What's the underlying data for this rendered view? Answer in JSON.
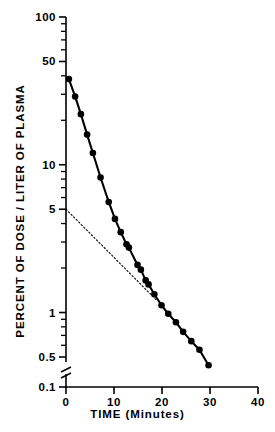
{
  "chart_data": {
    "type": "line",
    "title": "",
    "xlabel": "TIME   (Minutes)",
    "ylabel": "PERCENT OF DOSE / LITER OF PLASMA",
    "yscale": "log",
    "xscale": "linear",
    "xlim": [
      0,
      40
    ],
    "ylim": [
      0.1,
      100
    ],
    "grid": false,
    "legend": null,
    "xticks": [
      {
        "value": 0,
        "label": "0"
      },
      {
        "value": 10,
        "label": "10"
      },
      {
        "value": 20,
        "label": "20"
      },
      {
        "value": 30,
        "label": "30"
      },
      {
        "value": 40,
        "label": "40"
      }
    ],
    "yticks_major": [
      {
        "value": 100,
        "label": "100"
      },
      {
        "value": 50,
        "label": "50"
      },
      {
        "value": 10,
        "label": "10"
      },
      {
        "value": 5,
        "label": "5"
      },
      {
        "value": 1,
        "label": "1"
      },
      {
        "value": 0.5,
        "label": "0.5"
      },
      {
        "value": 0.1,
        "label": "0.1"
      }
    ],
    "yticks_minor": [
      90,
      80,
      70,
      60,
      40,
      30,
      20,
      9,
      8,
      7,
      6,
      4,
      3,
      2,
      0.9,
      0.8,
      0.7,
      0.6,
      0.4,
      0.3,
      0.2
    ],
    "axis_break": {
      "axis": "y",
      "between": [
        0.5,
        0.1
      ],
      "symbol": "zigzag"
    },
    "series": [
      {
        "name": "plasma concentration",
        "style": "solid-line-with-filled-circles",
        "marker": "filled-circle",
        "points": [
          {
            "x": 0.6,
            "y": 38.0
          },
          {
            "x": 1.9,
            "y": 29.0
          },
          {
            "x": 3.1,
            "y": 22.0
          },
          {
            "x": 4.4,
            "y": 16.0
          },
          {
            "x": 5.6,
            "y": 12.0
          },
          {
            "x": 7.2,
            "y": 8.2
          },
          {
            "x": 8.9,
            "y": 5.6
          },
          {
            "x": 10.2,
            "y": 4.3
          },
          {
            "x": 11.4,
            "y": 3.5
          },
          {
            "x": 12.6,
            "y": 2.9
          },
          {
            "x": 13.1,
            "y": 2.75
          },
          {
            "x": 14.9,
            "y": 2.1
          },
          {
            "x": 15.6,
            "y": 1.95
          },
          {
            "x": 16.6,
            "y": 1.65
          },
          {
            "x": 17.2,
            "y": 1.55
          },
          {
            "x": 18.4,
            "y": 1.33
          },
          {
            "x": 19.9,
            "y": 1.12
          },
          {
            "x": 21.3,
            "y": 0.98
          },
          {
            "x": 22.9,
            "y": 0.86
          },
          {
            "x": 24.4,
            "y": 0.74
          },
          {
            "x": 26.1,
            "y": 0.64
          },
          {
            "x": 27.8,
            "y": 0.56
          },
          {
            "x": 29.7,
            "y": 0.44
          }
        ]
      },
      {
        "name": "terminal-phase extrapolation",
        "style": "dotted-line",
        "marker": "none",
        "points": [
          {
            "x": 0.0,
            "y": 5.0
          },
          {
            "x": 19.0,
            "y": 1.2
          }
        ]
      }
    ]
  },
  "axes": {
    "x_title": "TIME   (Minutes)",
    "y_title": "PERCENT OF DOSE / LITER OF PLASMA"
  }
}
